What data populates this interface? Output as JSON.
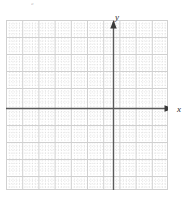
{
  "figure": {
    "name": "blank-cartesian-coordinate-grid",
    "background_color": "#ffffff",
    "corner_mark_text": "a",
    "axes": {
      "x_axis_label": "x",
      "y_axis_label": "y",
      "axis_color": "#5a5a5a",
      "arrow_color": "#3a3a3a",
      "x_axis_has_arrow": true,
      "y_axis_has_arrow": true,
      "tick_labels_shown": "none",
      "origin_marked": false
    },
    "grid": {
      "major_color": "#d0d0d0",
      "minor_color": "#dcdcdc",
      "major_columns": 10,
      "major_rows": 10,
      "minor_per_major": 5,
      "grid_style": "dotted-minor-solid-major"
    }
  },
  "chart_data": {
    "type": "scatter",
    "title": "",
    "subtitle": "",
    "xlabel": "x",
    "ylabel": "y",
    "series": [
      {
        "name": "",
        "x": [],
        "y": []
      }
    ],
    "categories": [],
    "values": [],
    "xlim": [
      -5,
      5
    ],
    "ylim": [
      -5,
      5
    ],
    "xticks": [
      -5,
      -4,
      -3,
      -2,
      -1,
      0,
      1,
      2,
      3,
      4,
      5
    ],
    "yticks": [
      -5,
      -4,
      -3,
      -2,
      -1,
      0,
      1,
      2,
      3,
      4,
      5
    ],
    "xtick_labels": [
      "",
      "",
      "",
      "",
      "",
      "",
      "",
      "",
      "",
      "",
      ""
    ],
    "ytick_labels": [
      "",
      "",
      "",
      "",
      "",
      "",
      "",
      "",
      "",
      "",
      ""
    ],
    "grid": true,
    "minor_grid": true,
    "legend": [],
    "legend_position": "none",
    "annotations": []
  }
}
